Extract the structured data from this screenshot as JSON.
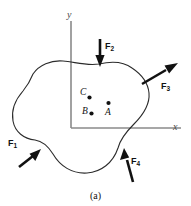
{
  "figure": {
    "caption": "(a)",
    "axes": {
      "y_label": "y",
      "x_label": "x"
    },
    "points": [
      {
        "id": "C",
        "label": "C"
      },
      {
        "id": "B",
        "label": "B"
      },
      {
        "id": "A",
        "label": "A"
      }
    ],
    "forces": [
      {
        "id": "F1",
        "base": "F",
        "sub": "1",
        "direction": "up-right"
      },
      {
        "id": "F2",
        "base": "F",
        "sub": "2",
        "direction": "down"
      },
      {
        "id": "F3",
        "base": "F",
        "sub": "3",
        "direction": "up-right"
      },
      {
        "id": "F4",
        "base": "F",
        "sub": "4",
        "direction": "up-left"
      }
    ],
    "colors": {
      "outline": "#2b2b2b",
      "axis": "#8a8a8a",
      "force": "#111111",
      "background": "#ffffff"
    }
  }
}
